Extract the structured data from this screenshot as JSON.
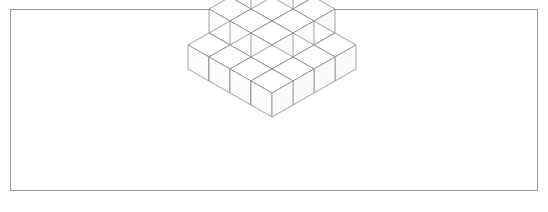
{
  "figure": {
    "background_color": "#ffffff",
    "frame": {
      "x": 10.5,
      "y": 9.5,
      "width": 527,
      "height": 181,
      "stroke_color": "#9a9a9a",
      "stroke_width": 1
    },
    "canvas": {
      "width": 548,
      "height": 212
    }
  },
  "chart_data": {
    "type": "diagram",
    "subtype": "isometric-cube-stack",
    "projection": {
      "half_width": 21,
      "half_depth": 12,
      "cube_height": 24,
      "origin_x": 272,
      "origin_y": 21
    },
    "levels": [
      {
        "level": 3,
        "label": "apex",
        "count": 1,
        "grid_size": 1
      },
      {
        "level": 2,
        "label": "second",
        "count": 4,
        "grid_size": 2
      },
      {
        "level": 1,
        "label": "third",
        "count": 9,
        "grid_size": 3
      },
      {
        "level": 0,
        "label": "base",
        "count": 16,
        "grid_size": 4
      }
    ],
    "total_cubes": 30,
    "cubes": [
      {
        "i": 0,
        "j": 0,
        "k": 0
      },
      {
        "i": 1,
        "j": 0,
        "k": 0
      },
      {
        "i": 2,
        "j": 0,
        "k": 0
      },
      {
        "i": 3,
        "j": 0,
        "k": 0
      },
      {
        "i": 0,
        "j": 1,
        "k": 0
      },
      {
        "i": 1,
        "j": 1,
        "k": 0
      },
      {
        "i": 2,
        "j": 1,
        "k": 0
      },
      {
        "i": 3,
        "j": 1,
        "k": 0
      },
      {
        "i": 0,
        "j": 2,
        "k": 0
      },
      {
        "i": 1,
        "j": 2,
        "k": 0
      },
      {
        "i": 2,
        "j": 2,
        "k": 0
      },
      {
        "i": 3,
        "j": 2,
        "k": 0
      },
      {
        "i": 0,
        "j": 3,
        "k": 0
      },
      {
        "i": 1,
        "j": 3,
        "k": 0
      },
      {
        "i": 2,
        "j": 3,
        "k": 0
      },
      {
        "i": 3,
        "j": 3,
        "k": 0
      },
      {
        "i": 0,
        "j": 0,
        "k": 1
      },
      {
        "i": 1,
        "j": 0,
        "k": 1
      },
      {
        "i": 2,
        "j": 0,
        "k": 1
      },
      {
        "i": 0,
        "j": 1,
        "k": 1
      },
      {
        "i": 1,
        "j": 1,
        "k": 1
      },
      {
        "i": 2,
        "j": 1,
        "k": 1
      },
      {
        "i": 0,
        "j": 2,
        "k": 1
      },
      {
        "i": 1,
        "j": 2,
        "k": 1
      },
      {
        "i": 2,
        "j": 2,
        "k": 1
      },
      {
        "i": 0,
        "j": 0,
        "k": 2
      },
      {
        "i": 1,
        "j": 0,
        "k": 2
      },
      {
        "i": 0,
        "j": 1,
        "k": 2
      },
      {
        "i": 1,
        "j": 1,
        "k": 2
      },
      {
        "i": 0,
        "j": 0,
        "k": 3
      }
    ],
    "colors": {
      "top_face": "#ffffff",
      "left_face": "#fcfcfc",
      "right_face": "#fafafa",
      "edge_stroke": "#8c8c8c",
      "frame_stroke": "#9a9a9a",
      "background": "#ffffff"
    },
    "xlabel": "",
    "ylabel": "",
    "legend": [],
    "annotations": [],
    "grid": false
  }
}
